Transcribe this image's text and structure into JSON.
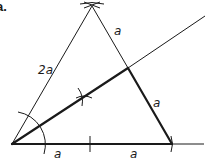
{
  "figure": {
    "part_label": "a.",
    "labels": {
      "left_side": "2a",
      "upper_right_side": "a",
      "lower_right_side": "a",
      "base_left": "a",
      "base_right": "a"
    },
    "colors": {
      "stroke": "#1a1a1a",
      "background": "#ffffff"
    }
  }
}
